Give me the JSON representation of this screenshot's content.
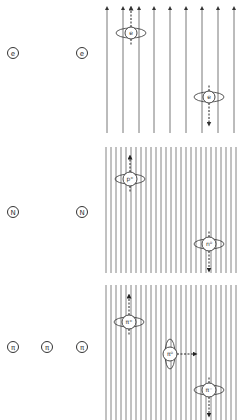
{
  "panels": [
    {
      "id": "electron",
      "left_labels": [
        "e",
        "e"
      ],
      "field_lines": 9,
      "field_direction": "up",
      "particles": [
        {
          "label": "e",
          "spin_arrow": "up"
        },
        {
          "label": "e",
          "spin_arrow": "down"
        }
      ]
    },
    {
      "id": "nucleon",
      "left_labels": [
        "N",
        "N"
      ],
      "field_lines": 27,
      "field_direction": "none",
      "particles": [
        {
          "label": "p⁺",
          "spin_arrow": "up"
        },
        {
          "label": "n⁰",
          "spin_arrow": "down"
        }
      ]
    },
    {
      "id": "pion",
      "left_labels": [
        "π",
        "π",
        "π"
      ],
      "field_lines": 27,
      "field_direction": "none",
      "particles": [
        {
          "label": "π⁺",
          "spin_arrow": "up"
        },
        {
          "label": "π⁰",
          "spin_arrow": "right"
        },
        {
          "label": "π⁻",
          "spin_arrow": "down"
        }
      ]
    }
  ]
}
